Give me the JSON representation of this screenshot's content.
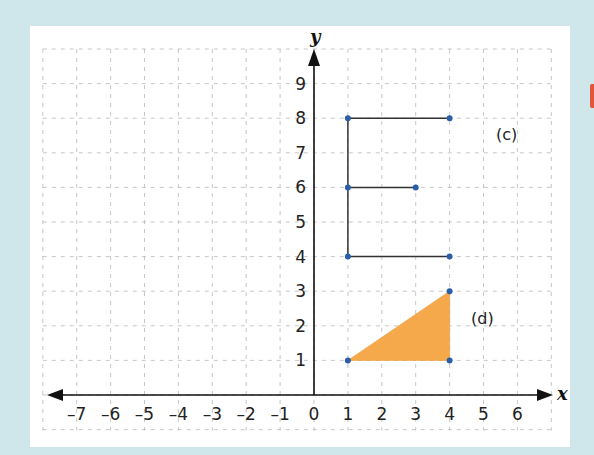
{
  "chart_data": {
    "type": "scatter",
    "title": "",
    "xlabel": "x",
    "ylabel": "y",
    "xlim": [
      -8,
      7
    ],
    "ylim": [
      -1,
      10
    ],
    "grid": true,
    "grid_style": "dashed",
    "x_ticks": [
      "–7",
      "–6",
      "–5",
      "–4",
      "–3",
      "–2",
      "–1",
      "0",
      "1",
      "2",
      "3",
      "4",
      "5",
      "6"
    ],
    "y_ticks": [
      "1",
      "2",
      "3",
      "4",
      "5",
      "6",
      "7",
      "8",
      "9"
    ],
    "shapes": [
      {
        "label": "(c)",
        "kind": "polyline (letter E)",
        "segments": [
          [
            [
              1,
              8
            ],
            [
              4,
              8
            ]
          ],
          [
            [
              1,
              6
            ],
            [
              3,
              6
            ]
          ],
          [
            [
              1,
              4
            ],
            [
              4,
              4
            ]
          ],
          [
            [
              1,
              4
            ],
            [
              1,
              8
            ]
          ]
        ],
        "points": [
          [
            1,
            8
          ],
          [
            4,
            8
          ],
          [
            1,
            6
          ],
          [
            3,
            6
          ],
          [
            1,
            4
          ],
          [
            4,
            4
          ]
        ],
        "label_position": [
          5.5,
          7.5
        ]
      },
      {
        "label": "(d)",
        "kind": "filled triangle",
        "points": [
          [
            1,
            1
          ],
          [
            4,
            1
          ],
          [
            4,
            3
          ]
        ],
        "fill": "#f5a94a",
        "label_position": [
          5.2,
          2.3
        ]
      }
    ],
    "point_color": "#2a5fa8",
    "line_color": "#333333"
  },
  "labels": {
    "c": "(c)",
    "d": "(d)",
    "x_axis": "x",
    "y_axis": "y"
  },
  "colors": {
    "background": "#cfe6ea",
    "panel": "#ffffff",
    "grid": "#b9b9b9",
    "axis": "#111111",
    "triangle_fill": "#f5a94a",
    "point": "#2a5fa8"
  }
}
